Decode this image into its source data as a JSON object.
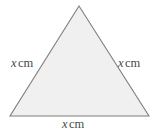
{
  "figure": {
    "name": "equilateral-triangle-diagram",
    "shape": "triangle",
    "fill_color": "#f0f0f0",
    "stroke_color": "#7f7f7f",
    "background_color": "#ffffff",
    "vertices": {
      "apex": [
        79,
        6
      ],
      "bottom_left": [
        10,
        116
      ],
      "bottom_right": [
        149,
        116
      ]
    }
  },
  "labels": {
    "left": {
      "variable": "x",
      "unit": "cm"
    },
    "right": {
      "variable": "x",
      "unit": "cm"
    },
    "bottom": {
      "variable": "x",
      "unit": "cm"
    }
  }
}
